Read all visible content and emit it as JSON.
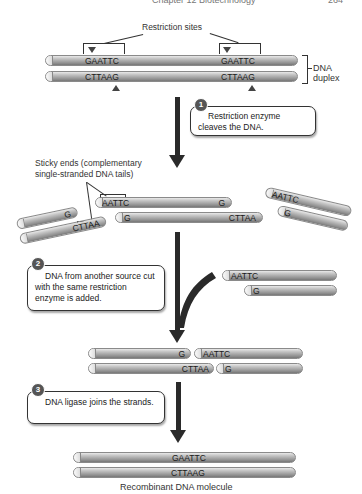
{
  "header": {
    "text": "Chapter 12  Biotechnology",
    "page": "264"
  },
  "stage1": {
    "label_sites": "Restriction sites",
    "top_strand_sites": [
      "GAATTC",
      "GAATTC"
    ],
    "bottom_strand_sites": [
      "CTTAAG",
      "CTTAAG"
    ],
    "duplex_label_line1": "DNA",
    "duplex_label_line2": "duplex"
  },
  "steps": [
    {
      "number": "1",
      "text": "Restriction enzyme cleaves the DNA."
    },
    {
      "number": "2",
      "text": "DNA from another source cut with the same restriction enzyme is added."
    },
    {
      "number": "3",
      "text": "DNA ligase joins the strands."
    }
  ],
  "stage2": {
    "sticky_label_line1": "Sticky ends (complementary",
    "sticky_label_line2": "single-stranded DNA tails)",
    "center_top_left": "AATTC",
    "center_top_right": "G",
    "center_bottom_left": "G",
    "center_bottom_right": "CTTAA",
    "left_frag_top": "G",
    "left_frag_bottom": "CTTAA",
    "right_frag_top": "AATTC",
    "right_frag_bottom": "G"
  },
  "stage3": {
    "foreign_top": "AATTC",
    "foreign_bottom": "G"
  },
  "stage4": {
    "top_left": "G",
    "top_right": "AATTC",
    "bottom_left": "CTTAA",
    "bottom_right": "G"
  },
  "stage5": {
    "top": "GAATTC",
    "bottom": "CTTAAG",
    "caption": "Recombinant DNA molecule"
  }
}
